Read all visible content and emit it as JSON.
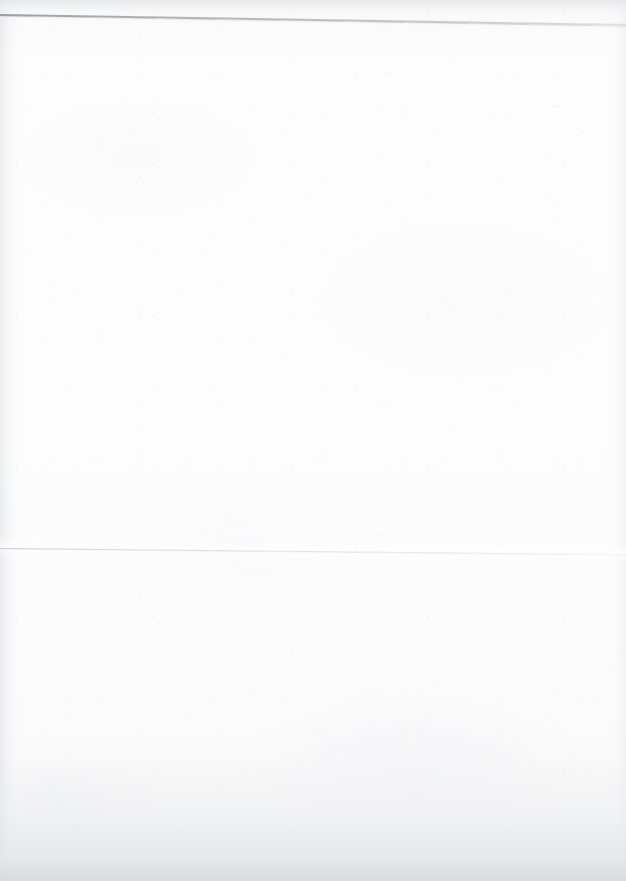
{
  "document": {
    "kind": "scanned-page",
    "title": "Blank scanned page",
    "page_width": 626,
    "page_height": 881,
    "background_color": "#fbfbfc",
    "body_text": "",
    "has_text_content": false,
    "notes": "Near-blank scanned sheet; only two faint horizontal ruled lines and paper grain are visible."
  },
  "rules": [
    {
      "name": "top-rule",
      "label": "",
      "color": "#9ba0a5",
      "left_y": 14,
      "right_y": 24,
      "thickness_px": 1.5,
      "tilt_deg": 0.92,
      "emphasis": "darker"
    },
    {
      "name": "middle-rule",
      "label": "",
      "color": "#d2d5d9",
      "left_y": 548,
      "right_y": 554,
      "thickness_px": 1,
      "tilt_deg": 0.55,
      "emphasis": "faint"
    }
  ],
  "regions": {
    "top_margin_band": {
      "label": "",
      "height_px": 15,
      "color": "#e2e4e6"
    },
    "upper_blank_area": {
      "label": "",
      "top_px": 25,
      "bottom_px": 547
    },
    "lower_blank_area": {
      "label": "",
      "top_px": 555,
      "bottom_px": 881
    },
    "left_gutter": {
      "label": "",
      "width_px": 26,
      "color": "#dee0e2"
    },
    "right_gutter": {
      "label": "",
      "width_px": 22,
      "color": "#e6e7e9"
    },
    "bottom_vignette": {
      "label": "",
      "height_px": 120,
      "color": "#d6d8db"
    }
  }
}
